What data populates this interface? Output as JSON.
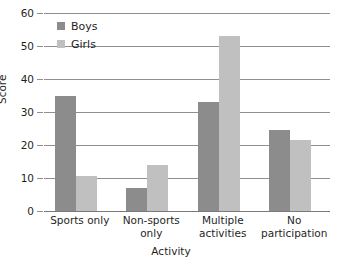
{
  "chart_data": {
    "type": "bar",
    "title": "",
    "xlabel": "Activity",
    "ylabel": "Score",
    "categories": [
      "Sports only",
      "Non-sports only",
      "Multiple activities",
      "No participation"
    ],
    "category_lines": [
      [
        "Sports only"
      ],
      [
        "Non-sports",
        "only"
      ],
      [
        "Multiple",
        "activities"
      ],
      [
        "No",
        "participation"
      ]
    ],
    "series": [
      {
        "name": "Boys",
        "color": "#8c8c8c",
        "values": [
          35,
          7,
          33,
          24.5
        ]
      },
      {
        "name": "Girls",
        "color": "#c0c0c0",
        "values": [
          10.5,
          14,
          53,
          21.5
        ]
      }
    ],
    "ylim": [
      0,
      60
    ],
    "ytick_step": 10,
    "yticks": [
      0,
      10,
      20,
      30,
      40,
      50,
      60
    ],
    "ytick_labels": [
      "0",
      "10",
      "20",
      "30",
      "40",
      "50",
      "60"
    ],
    "grid": true,
    "grid_axis": "y",
    "legend_position": "top-left-inside",
    "legend": [
      {
        "label": "Boys",
        "color": "#8c8c8c"
      },
      {
        "label": "Girls",
        "color": "#c0c0c0"
      }
    ],
    "background_color": "#ffffff",
    "gridline_color": "#8f8f8f"
  }
}
